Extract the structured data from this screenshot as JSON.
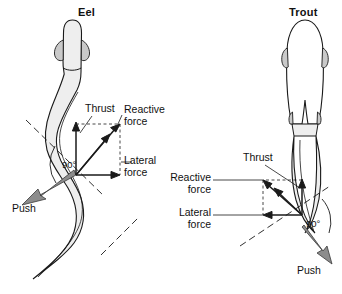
{
  "figure": {
    "kind": "biomechanics-diagram",
    "background_color": "#ffffff",
    "ink_color": "#1a1a1a",
    "body_fill_color": "#eeeeee",
    "push_arrow_color": "#8c8c8c"
  },
  "panels": [
    {
      "id": "eel",
      "title": "Eel",
      "swimming_mode": "anguilliform",
      "labels": {
        "thrust": "Thrust",
        "reactive_force": "Reactive\nforce",
        "lateral_force": "Lateral\nforce",
        "push": "Push",
        "angle": "90°"
      }
    },
    {
      "id": "trout",
      "title": "Trout",
      "swimming_mode": "subcarangiform",
      "labels": {
        "thrust": "Thrust",
        "reactive_force": "Reactive\nforce",
        "lateral_force": "Lateral\nforce",
        "push": "Push",
        "angle": "90°"
      }
    }
  ],
  "vectors": {
    "thrust": "Thrust",
    "reactive_force": "Reactive force",
    "lateral_force": "Lateral force",
    "push": "Push",
    "right_angle": "90°"
  }
}
